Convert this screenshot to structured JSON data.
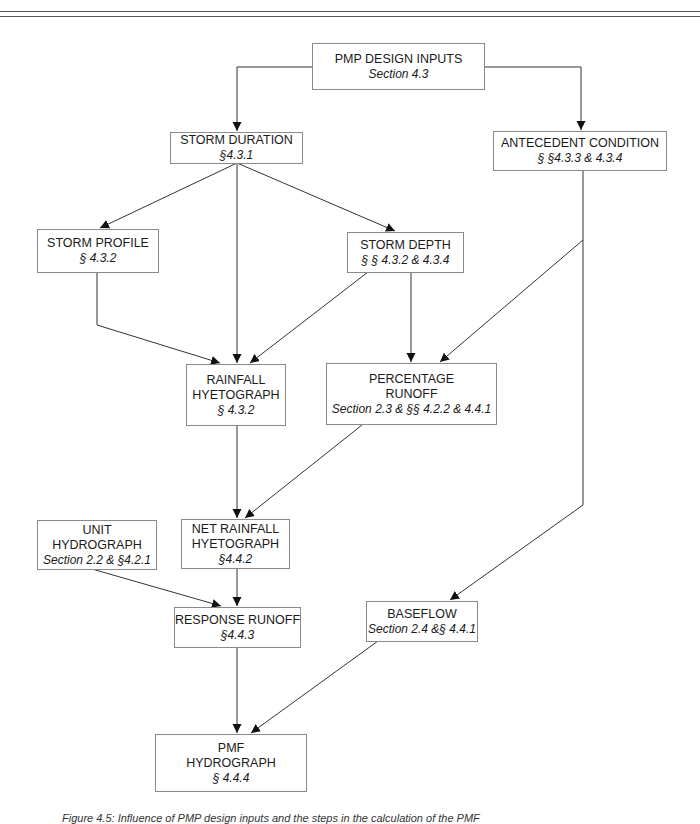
{
  "nodes": {
    "pmp_design_inputs": {
      "title": "PMP DESIGN  INPUTS",
      "ref": "Section 4.3"
    },
    "storm_duration": {
      "title": "STORM DURATION",
      "ref": "§4.3.1"
    },
    "antecedent_condition": {
      "title": "ANTECEDENT CONDITION",
      "ref": "§ §4.3.3 & 4.3.4"
    },
    "storm_profile": {
      "title": "STORM PROFILE",
      "ref": "§ 4.3.2"
    },
    "storm_depth": {
      "title": "STORM DEPTH",
      "ref": "§ § 4.3.2 & 4.3.4"
    },
    "rainfall_hyetograph": {
      "title1": "RAINFALL",
      "title2": "HYETOGRAPH",
      "ref": "§ 4.3.2"
    },
    "percentage_runoff": {
      "title1": "PERCENTAGE",
      "title2": "RUNOFF",
      "ref": "Section 2.3 & §§ 4.2.2 & 4.4.1"
    },
    "unit_hydrograph": {
      "title1": "UNIT",
      "title2": "HYDROGRAPH",
      "ref": "Section 2.2 & §4.2.1"
    },
    "net_rainfall_hyetograph": {
      "title1": "NET RAINFALL",
      "title2": "HYETOGRAPH",
      "ref": "§4.4.2"
    },
    "response_runoff": {
      "title": "RESPONSE RUNOFF",
      "ref": "§4.4.3"
    },
    "baseflow": {
      "title": "BASEFLOW",
      "ref": "Section 2.4 &§ 4.4.1"
    },
    "pmf_hydrograph": {
      "title1": "PMF",
      "title2": "HYDROGRAPH",
      "ref": "§ 4.4.4"
    }
  },
  "edges": [
    [
      "pmp_design_inputs",
      "storm_duration"
    ],
    [
      "pmp_design_inputs",
      "antecedent_condition"
    ],
    [
      "storm_duration",
      "storm_profile"
    ],
    [
      "storm_duration",
      "rainfall_hyetograph"
    ],
    [
      "storm_duration",
      "storm_depth"
    ],
    [
      "storm_profile",
      "rainfall_hyetograph"
    ],
    [
      "storm_depth",
      "rainfall_hyetograph"
    ],
    [
      "storm_depth",
      "percentage_runoff"
    ],
    [
      "antecedent_condition",
      "percentage_runoff"
    ],
    [
      "antecedent_condition",
      "baseflow"
    ],
    [
      "rainfall_hyetograph",
      "net_rainfall_hyetograph"
    ],
    [
      "percentage_runoff",
      "net_rainfall_hyetograph"
    ],
    [
      "unit_hydrograph",
      "response_runoff"
    ],
    [
      "net_rainfall_hyetograph",
      "response_runoff"
    ],
    [
      "response_runoff",
      "pmf_hydrograph"
    ],
    [
      "baseflow",
      "pmf_hydrograph"
    ]
  ],
  "caption": "Figure 4.5: Influence of PMP design inputs and the steps in the calculation of the PMF"
}
